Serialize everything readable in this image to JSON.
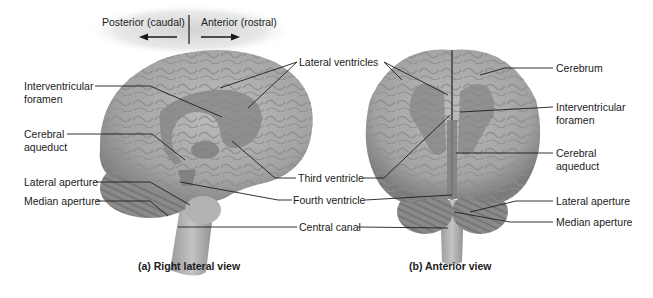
{
  "orientation": {
    "posterior_label": "Posterior (caudal)",
    "anterior_label": "Anterior (rostral)"
  },
  "shared_labels": {
    "lateral_ventricles": "Lateral ventricles",
    "third_ventricle": "Third ventricle",
    "fourth_ventricle": "Fourth ventricle",
    "central_canal": "Central canal"
  },
  "lateral_view": {
    "caption": "(a) Right lateral view",
    "labels": {
      "interventricular_foramen_1": "Interventricular",
      "interventricular_foramen_2": "foramen",
      "cerebral_aqueduct_1": "Cerebral",
      "cerebral_aqueduct_2": "aqueduct",
      "lateral_aperture": "Lateral aperture",
      "median_aperture": "Median aperture"
    }
  },
  "anterior_view": {
    "caption": "(b) Anterior view",
    "labels": {
      "cerebrum": "Cerebrum",
      "interventricular_foramen_1": "Interventricular",
      "interventricular_foramen_2": "foramen",
      "cerebral_aqueduct_1": "Cerebral",
      "cerebral_aqueduct_2": "aqueduct",
      "lateral_aperture": "Lateral aperture",
      "median_aperture": "Median aperture"
    }
  },
  "colors": {
    "brain_fill": "#a9a9a9",
    "brain_shadow": "#7d7d7d",
    "ventricle_fill": "#8a8a8a",
    "leader_line": "#1e1e1e",
    "header_glow": "#dcdcdc"
  }
}
